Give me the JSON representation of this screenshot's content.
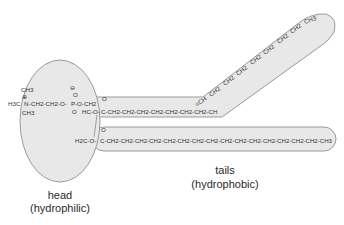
{
  "diagram": {
    "type": "phospholipid structure",
    "colors": {
      "region_fill": "#e8e8e8",
      "region_stroke": "#9a9a9a",
      "text": "#333333"
    },
    "head_group": {
      "choline": {
        "top_methyl": "CH3",
        "charge": "⊕",
        "left_methyl": "H3C",
        "nitrogen": "N",
        "bottom_methyl": "CH3",
        "chain": "-CH2-CH2-O-"
      },
      "phosphate": {
        "charge": "⊖",
        "top_oxygen": "O",
        "phosphorus": "P",
        "bottom_oxygen": "O",
        "link": "-O-CH2"
      },
      "glycerol": {
        "middle": "HC-O-",
        "bottom": "H2C-O-"
      }
    },
    "upper_tail": {
      "carbonyl": "O",
      "straight_part": "C-CH2-CH2-CH2-CH2-CH2-CH2-CH2-CH",
      "double_bond": "=CH",
      "bent_part": [
        "CH2",
        "CH2",
        "CH2",
        "CH2",
        "CH2",
        "CH2",
        "CH2",
        "CH3"
      ]
    },
    "lower_tail": {
      "carbonyl": "O",
      "chain": "C-CH2-CH2-CH2-CH2-CH2-CH2-CH2-CH2-CH2-CH2-CH2-CH2-CH2-CH2-CH2-CH3"
    },
    "labels": {
      "head_title": "head",
      "head_subtitle": "(hydrophilic)",
      "tails_title": "tails",
      "tails_subtitle": "(hydrophobic)"
    }
  }
}
